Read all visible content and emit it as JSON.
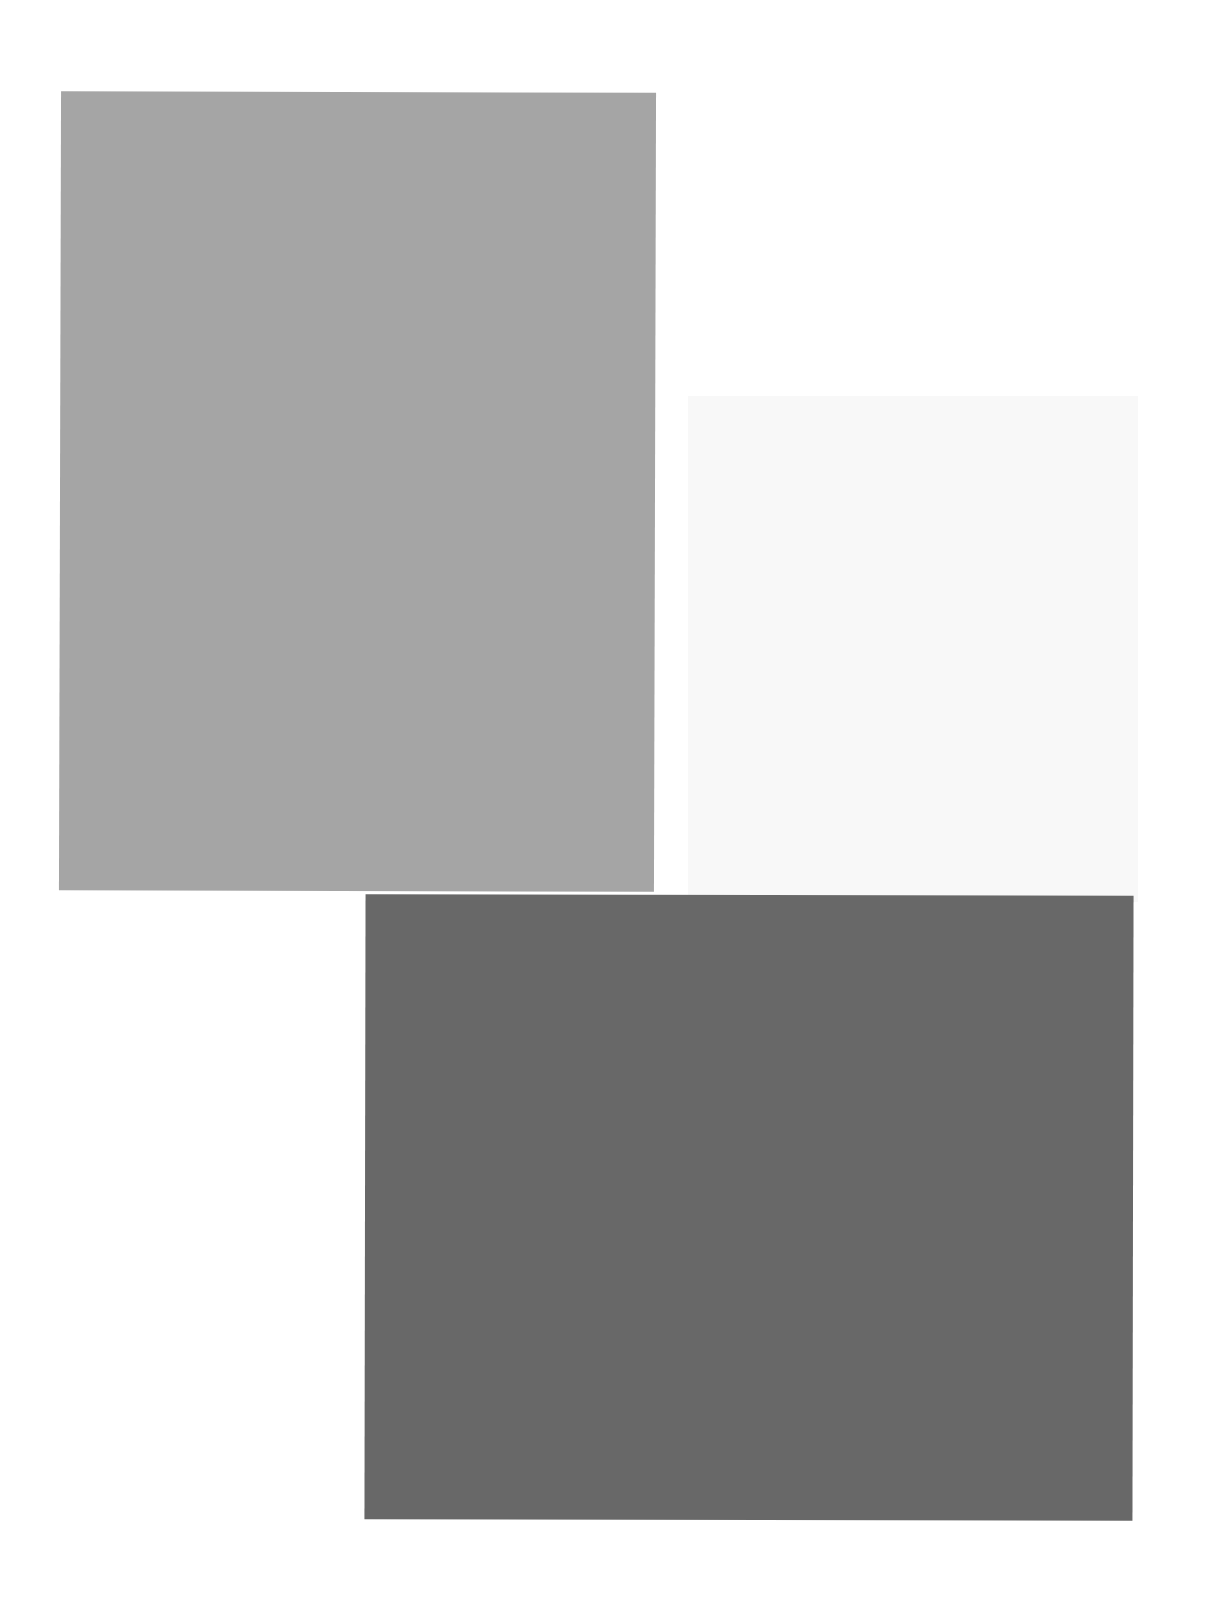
{
  "canvas": {
    "width": 1216,
    "height": 1603,
    "background": "#ffffff"
  },
  "shapes": [
    {
      "name": "medium-gray-rectangle",
      "color": "#a5a5a5"
    },
    {
      "name": "light-gray-rectangle",
      "color": "#f8f8f8"
    },
    {
      "name": "dark-gray-rectangle",
      "color": "#686868"
    }
  ]
}
